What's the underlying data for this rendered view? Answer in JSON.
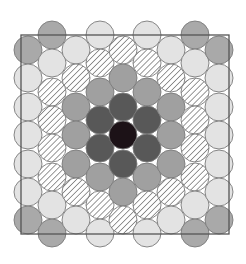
{
  "figure": {
    "square": {
      "x": 21,
      "y": 35,
      "width": 208,
      "height": 199,
      "stroke": "#555555"
    },
    "circle_radius": 14,
    "fills": {
      "B": {
        "name": "center",
        "color": "#1c1217"
      },
      "D": {
        "name": "ring-1",
        "color": "#585858"
      },
      "M": {
        "name": "ring-2",
        "color": "#a0a0a0"
      },
      "H": {
        "name": "ring-3-hatched",
        "color": "#ffffff",
        "hatch": "#6e6e6e"
      },
      "L": {
        "name": "ring-4",
        "color": "#e3e3e3"
      },
      "G": {
        "name": "corner",
        "color": "#a9a9a9"
      }
    },
    "odd_rows_y": [
      50,
      78,
      107,
      135,
      164,
      192,
      220
    ],
    "even_rows_y": [
      35,
      63,
      92,
      120,
      148,
      177,
      205,
      233
    ],
    "columns": [
      {
        "x": 28,
        "parity": "odd",
        "cells": [
          "G",
          "L",
          "L",
          "L",
          "L",
          "L",
          "G"
        ]
      },
      {
        "x": 52,
        "parity": "even",
        "cells": [
          "G",
          "L",
          "H",
          "H",
          "H",
          "H",
          "L",
          "G"
        ]
      },
      {
        "x": 76,
        "parity": "odd",
        "cells": [
          "L",
          "H",
          "M",
          "M",
          "M",
          "H",
          "L"
        ]
      },
      {
        "x": 100,
        "parity": "even",
        "cells": [
          "L",
          "H",
          "M",
          "D",
          "D",
          "M",
          "H",
          "L"
        ]
      },
      {
        "x": 123,
        "parity": "odd",
        "cells": [
          "H",
          "M",
          "D",
          "B",
          "D",
          "M",
          "H"
        ]
      },
      {
        "x": 147,
        "parity": "even",
        "cells": [
          "L",
          "H",
          "M",
          "D",
          "D",
          "M",
          "H",
          "L"
        ]
      },
      {
        "x": 171,
        "parity": "odd",
        "cells": [
          "L",
          "H",
          "M",
          "M",
          "M",
          "H",
          "L"
        ]
      },
      {
        "x": 195,
        "parity": "even",
        "cells": [
          "G",
          "L",
          "H",
          "H",
          "H",
          "H",
          "L",
          "G"
        ]
      },
      {
        "x": 219,
        "parity": "odd",
        "cells": [
          "G",
          "L",
          "L",
          "L",
          "L",
          "L",
          "G"
        ]
      }
    ]
  }
}
